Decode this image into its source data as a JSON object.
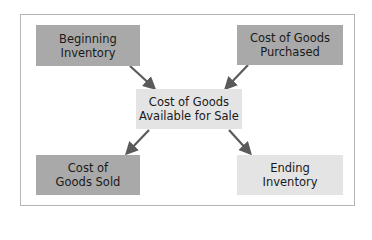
{
  "diagram": {
    "nodes": {
      "beginning_inventory": {
        "label_line1": "Beginning",
        "label_line2": "Inventory",
        "color": "#a9a9a9"
      },
      "cost_purchased": {
        "label_line1": "Cost of Goods",
        "label_line2": "Purchased",
        "color": "#a9a9a9"
      },
      "available": {
        "label_line1": "Cost of Goods",
        "label_line2": "Available for Sale",
        "color": "#e4e4e4"
      },
      "cost_sold": {
        "label_line1": "Cost of",
        "label_line2": "Goods Sold",
        "color": "#a9a9a9"
      },
      "ending_inventory": {
        "label_line1": "Ending",
        "label_line2": "Inventory",
        "color": "#e4e4e4"
      }
    },
    "edges": [
      {
        "from": "beginning_inventory",
        "to": "available"
      },
      {
        "from": "cost_purchased",
        "to": "available"
      },
      {
        "from": "available",
        "to": "cost_sold"
      },
      {
        "from": "available",
        "to": "ending_inventory"
      }
    ],
    "arrow_color": "#5a5a5a",
    "frame_color": "#b5b5b5"
  }
}
